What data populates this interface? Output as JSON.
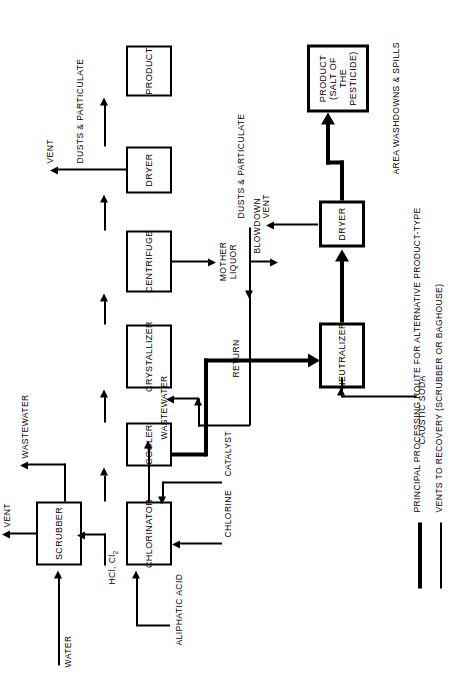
{
  "diagram": {
    "orientation": "rotated-90-ccw"
  },
  "units": [
    {
      "id": "scrubber",
      "label": "SCRUBBER"
    },
    {
      "id": "chlorinator",
      "label": "CHLORINATOR"
    },
    {
      "id": "cooler",
      "label": "COOLER"
    },
    {
      "id": "crystallizer",
      "label": "CRYSTALLIZER"
    },
    {
      "id": "centrifuge",
      "label": "CENTRIFUGE"
    },
    {
      "id": "dryer_main",
      "label": "DRYER"
    },
    {
      "id": "product_main",
      "label": "PRODUCT"
    },
    {
      "id": "neutralizer",
      "label": "NEUTRALIZER"
    },
    {
      "id": "dryer_alt",
      "label": "DRYER"
    },
    {
      "id": "product_alt",
      "label": "PRODUCT\n(SALT OF THE\nPESTICIDE)"
    }
  ],
  "product_alt_lines": {
    "l1": "PRODUCT",
    "l2": "(SALT OF THE",
    "l3": "PESTICIDE)"
  },
  "streams": {
    "water": "WATER",
    "aliphatic_acid": "ALIPHATIC ACID",
    "chlorine": "CHLORINE",
    "catalyst": "CATALYST",
    "caustic_soda": "CAUSTIC SODA",
    "hcl_cl2": "HCl, Cl",
    "hcl_cl2_sub": "2",
    "vent_scrubber": "VENT",
    "wastewater_scrubber": "WASTEWATER",
    "wastewater_chlorinator": "WASTEWATER",
    "mother_liquor_l1": "MOTHER",
    "mother_liquor_l2": "LIQUOR",
    "blowdown": "BLOWDOWN",
    "return": "RETURN",
    "vent_dryer_main": "VENT",
    "dusts_main": "DUSTS & PARTICULATE",
    "vent_dryer_alt": "VENT",
    "dusts_alt": "DUSTS & PARTICULATE",
    "area_washdowns": "AREA WASHDOWNS & SPILLS"
  },
  "legend": {
    "line1": "PRINCIPAL PROCESSING ROUTE FOR ALTERNATIVE PRODUCT-TYPE",
    "line2": "VENTS TO RECOVERY (SCRUBBER OR BAGHOUSE)"
  },
  "colors": {
    "ink": "#000000",
    "paper": "#ffffff"
  }
}
